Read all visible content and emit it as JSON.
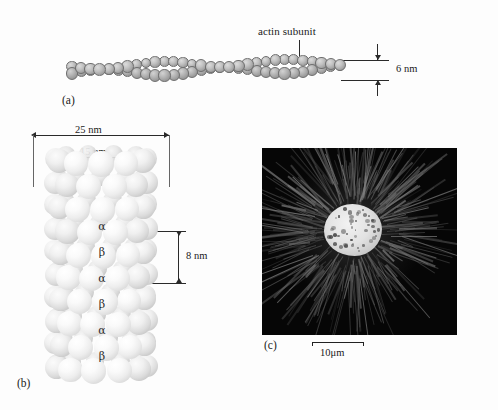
{
  "figure": {
    "background_color": "#fdfdfd",
    "panels": [
      {
        "tag": "(a)",
        "name": "actin-filament",
        "callout_label": "actin subunit",
        "dimension_label": "6 nm"
      },
      {
        "tag": "(b)",
        "name": "microtubule",
        "dimension_width_outer": "25 nm",
        "dimension_width_inner": "15 nm",
        "dimension_height": "8 nm",
        "subunit_labels": [
          "α",
          "β",
          "α",
          "β",
          "α",
          "β"
        ]
      },
      {
        "tag": "(c)",
        "name": "fluorescence-micrograph",
        "scale_label": "10μm",
        "frame_color": "#060606"
      }
    ]
  },
  "panel_a": {
    "tag": "(a)",
    "callout": "actin subunit",
    "dimension": "6 nm"
  },
  "panel_b": {
    "tag": "(b)",
    "dim_outer": "25 nm",
    "dim_inner": "15 nm",
    "dim_rise": "8 nm",
    "alpha": "α",
    "beta": "β",
    "labels": [
      "α",
      "β",
      "α",
      "β",
      "α",
      "β"
    ]
  },
  "panel_c": {
    "tag": "(c)",
    "scale": "10μm"
  }
}
